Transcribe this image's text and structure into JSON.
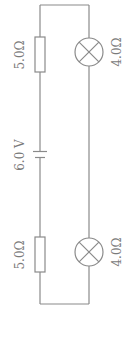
{
  "diagram": {
    "type": "circuit",
    "colors": {
      "line": "#8a8a8a",
      "text": "#7a7a7a",
      "background": "#ffffff"
    },
    "battery": {
      "label": "6.0 V"
    },
    "resistors": [
      {
        "position": "top-left",
        "label": "5.0Ω"
      },
      {
        "position": "bottom-left",
        "label": "5.0Ω"
      }
    ],
    "lamps": [
      {
        "position": "top-right",
        "label": "4.0Ω"
      },
      {
        "position": "bottom-right",
        "label": "4.0Ω"
      }
    ]
  }
}
